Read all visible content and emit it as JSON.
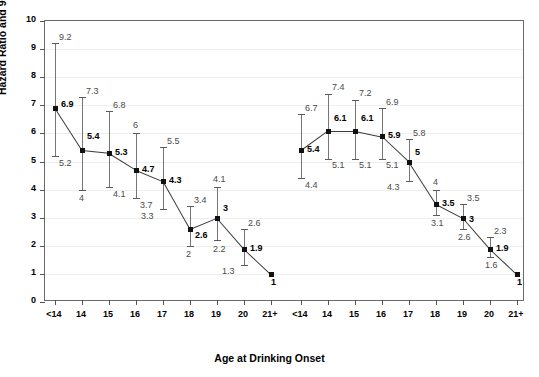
{
  "chart_data": {
    "type": "line",
    "title": "",
    "xlabel": "Age at Drinking Onset",
    "ylabel": "Hazard Ratio and 95% CI",
    "ylim": [
      0,
      10
    ],
    "ytick_labels": [
      "0",
      "1",
      "2",
      "3",
      "4",
      "5",
      "6",
      "7",
      "8",
      "9",
      "10"
    ],
    "grid": true,
    "legend": "none",
    "categories": [
      "<14",
      "14",
      "15",
      "16",
      "17",
      "18",
      "19",
      "20",
      "21+"
    ],
    "groups": [
      {
        "name": "Panel 1",
        "points": [
          {
            "x": "<14",
            "value": "6.9",
            "low": "5.2",
            "high": "9.2"
          },
          {
            "x": "14",
            "value": "5.4",
            "low": "4",
            "high": "7.3"
          },
          {
            "x": "15",
            "value": "5.3",
            "low": "4.1",
            "high": "6.8"
          },
          {
            "x": "16",
            "value": "4.7",
            "low": "3.7",
            "high": "6"
          },
          {
            "x": "17",
            "value": "4.3",
            "low": "3.3",
            "high": "5.5"
          },
          {
            "x": "18",
            "value": "2.6",
            "low": "2",
            "high": "3.4"
          },
          {
            "x": "19",
            "value": "3",
            "low": "2.2",
            "high": "4.1"
          },
          {
            "x": "20",
            "value": "1.9",
            "low": "1.3",
            "high": "2.6"
          },
          {
            "x": "21+",
            "value": "1",
            "low": "",
            "high": ""
          }
        ]
      },
      {
        "name": "Panel 2",
        "points": [
          {
            "x": "<14",
            "value": "5.4",
            "low": "4.4",
            "high": "6.7"
          },
          {
            "x": "14",
            "value": "6.1",
            "low": "5.1",
            "high": "7.4"
          },
          {
            "x": "15",
            "value": "6.1",
            "low": "5.1",
            "high": "7.2"
          },
          {
            "x": "16",
            "value": "5.9",
            "low": "5.1",
            "high": "6.9"
          },
          {
            "x": "17",
            "value": "5",
            "low": "4.3",
            "high": "5.8"
          },
          {
            "x": "18",
            "value": "3.5",
            "low": "3.1",
            "high": "4"
          },
          {
            "x": "19",
            "value": "3",
            "low": "2.6",
            "high": "3.5"
          },
          {
            "x": "20",
            "value": "1.9",
            "low": "1.6",
            "high": "2.3"
          },
          {
            "x": "21+",
            "value": "1",
            "low": "",
            "high": ""
          }
        ]
      }
    ],
    "colors": {
      "marker": "#111111",
      "line": "#3a3a3a",
      "whisker": "#767676",
      "grid": "#eeeeee",
      "frame": "#6b6b6b"
    }
  }
}
